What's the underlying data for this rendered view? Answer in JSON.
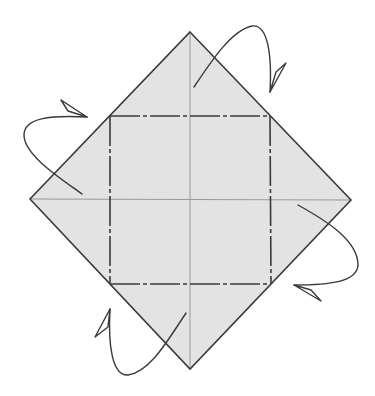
{
  "diagram": {
    "type": "origami-fold-diagram",
    "colors": {
      "background": "#ffffff",
      "paper_fill": "#e6e6e6",
      "outline": "#3a3a3a",
      "crease": "#9a9a9a",
      "mountain_fold": "#3a3a3a",
      "arrow": "#3a3a3a"
    },
    "paper": {
      "shape": "diamond",
      "top": [
        190,
        32
      ],
      "right": [
        351,
        200
      ],
      "bottom": [
        190,
        369
      ],
      "left": [
        30,
        199
      ]
    },
    "creases": [
      {
        "name": "vertical-center",
        "from": [
          190,
          32
        ],
        "to": [
          190,
          369
        ]
      },
      {
        "name": "horizontal-center",
        "from": [
          30,
          199
        ],
        "to": [
          351,
          200
        ]
      }
    ],
    "mountain_folds": [
      {
        "name": "top",
        "from": [
          110,
          116
        ],
        "to": [
          270,
          116
        ]
      },
      {
        "name": "right",
        "from": [
          270,
          116
        ],
        "to": [
          271,
          284
        ]
      },
      {
        "name": "bottom",
        "from": [
          110,
          284
        ],
        "to": [
          271,
          284
        ]
      },
      {
        "name": "left",
        "from": [
          110,
          116
        ],
        "to": [
          110,
          284
        ]
      }
    ],
    "arrows": [
      {
        "name": "fold-top-corner-behind",
        "kind": "fold-behind"
      },
      {
        "name": "fold-left-corner-behind",
        "kind": "fold-behind"
      },
      {
        "name": "fold-right-corner-behind",
        "kind": "fold-behind"
      },
      {
        "name": "fold-bottom-corner-behind",
        "kind": "fold-behind"
      }
    ]
  }
}
